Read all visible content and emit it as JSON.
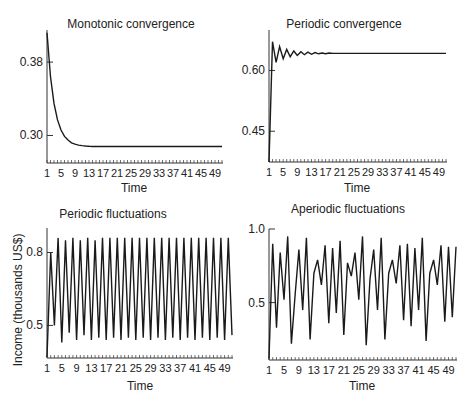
{
  "figure": {
    "shared_ylabel": "Income (thousands US$)",
    "line_color": "#1a1a1a",
    "axis_color": "#333333",
    "text_color": "#222222"
  },
  "chart_data": [
    {
      "type": "line",
      "title": "Monotonic convergence",
      "xlabel": "Time",
      "ylabel": "",
      "x_ticks": [
        1,
        5,
        9,
        13,
        17,
        21,
        25,
        29,
        33,
        37,
        41,
        45,
        49
      ],
      "y_ticks": [
        0.3,
        0.38
      ],
      "y_tick_labels": [
        "0.30",
        "0.38"
      ],
      "ylim": [
        0.27,
        0.415
      ],
      "x": [
        1,
        2,
        3,
        4,
        5,
        6,
        7,
        8,
        9,
        10,
        11,
        12,
        13,
        14,
        15,
        16,
        17,
        18,
        19,
        20,
        21,
        22,
        23,
        24,
        25,
        26,
        27,
        28,
        29,
        30,
        31,
        32,
        33,
        34,
        35,
        36,
        37,
        38,
        39,
        40,
        41,
        42,
        43,
        44,
        45,
        46,
        47,
        48,
        49,
        50,
        51
      ],
      "values": [
        0.412,
        0.364,
        0.335,
        0.317,
        0.306,
        0.299,
        0.295,
        0.292,
        0.2905,
        0.2895,
        0.289,
        0.2885,
        0.2882,
        0.288,
        0.288,
        0.288,
        0.288,
        0.288,
        0.288,
        0.288,
        0.288,
        0.288,
        0.288,
        0.288,
        0.288,
        0.288,
        0.288,
        0.288,
        0.288,
        0.288,
        0.288,
        0.288,
        0.288,
        0.288,
        0.288,
        0.288,
        0.288,
        0.288,
        0.288,
        0.288,
        0.288,
        0.288,
        0.288,
        0.288,
        0.288,
        0.288,
        0.288,
        0.288,
        0.288,
        0.288,
        0.288
      ],
      "grid": false
    },
    {
      "type": "line",
      "title": "Periodic convergence",
      "xlabel": "Time",
      "ylabel": "",
      "x_ticks": [
        1,
        5,
        9,
        13,
        17,
        21,
        25,
        29,
        33,
        37,
        41,
        45,
        49
      ],
      "y_ticks": [
        0.45,
        0.6
      ],
      "y_tick_labels": [
        "0.45",
        "0.60"
      ],
      "ylim": [
        0.374,
        0.69
      ],
      "x": [
        1,
        2,
        3,
        4,
        5,
        6,
        7,
        8,
        9,
        10,
        11,
        12,
        13,
        14,
        15,
        16,
        17,
        18,
        19,
        20,
        21,
        22,
        23,
        24,
        25,
        26,
        27,
        28,
        29,
        30,
        31,
        32,
        33,
        34,
        35,
        36,
        37,
        38,
        39,
        40,
        41,
        42,
        43,
        44,
        45,
        46,
        47,
        48,
        49,
        50,
        51
      ],
      "values": [
        0.374,
        0.671,
        0.62,
        0.659,
        0.629,
        0.652,
        0.634,
        0.648,
        0.637,
        0.646,
        0.639,
        0.645,
        0.64,
        0.644,
        0.641,
        0.643,
        0.641,
        0.643,
        0.642,
        0.642,
        0.642,
        0.642,
        0.642,
        0.642,
        0.642,
        0.642,
        0.642,
        0.642,
        0.642,
        0.642,
        0.642,
        0.642,
        0.642,
        0.642,
        0.642,
        0.642,
        0.642,
        0.642,
        0.642,
        0.642,
        0.642,
        0.642,
        0.642,
        0.642,
        0.642,
        0.642,
        0.642,
        0.642,
        0.642,
        0.642,
        0.642
      ],
      "grid": false
    },
    {
      "type": "line",
      "title": "Periodic fluctuations",
      "xlabel": "Time",
      "ylabel": "Income (thousands US$)",
      "x_ticks": [
        1,
        5,
        9,
        13,
        17,
        21,
        25,
        29,
        33,
        37,
        41,
        45,
        49
      ],
      "y_ticks": [
        0.5,
        0.8
      ],
      "y_tick_labels": [
        "0.5",
        "0.8"
      ],
      "ylim": [
        0.366,
        0.88
      ],
      "x": [
        1,
        2,
        3,
        4,
        5,
        6,
        7,
        8,
        9,
        10,
        11,
        12,
        13,
        14,
        15,
        16,
        17,
        18,
        19,
        20,
        21,
        22,
        23,
        24,
        25,
        26,
        27,
        28,
        29,
        30,
        31,
        32,
        33,
        34,
        35,
        36,
        37,
        38,
        39,
        40,
        41,
        42,
        43,
        44,
        45,
        46,
        47,
        48,
        49,
        50,
        51
      ],
      "values": [
        0.37,
        0.8,
        0.5,
        0.86,
        0.43,
        0.85,
        0.47,
        0.86,
        0.44,
        0.85,
        0.46,
        0.86,
        0.44,
        0.85,
        0.45,
        0.86,
        0.44,
        0.86,
        0.45,
        0.86,
        0.44,
        0.86,
        0.45,
        0.86,
        0.44,
        0.86,
        0.45,
        0.86,
        0.44,
        0.86,
        0.45,
        0.86,
        0.44,
        0.86,
        0.45,
        0.86,
        0.44,
        0.86,
        0.45,
        0.86,
        0.44,
        0.86,
        0.45,
        0.86,
        0.44,
        0.86,
        0.45,
        0.86,
        0.44,
        0.86,
        0.46
      ],
      "grid": false
    },
    {
      "type": "line",
      "title": "Aperiodic fluctuations",
      "xlabel": "Time",
      "ylabel": "",
      "x_ticks": [
        1,
        5,
        9,
        13,
        17,
        21,
        25,
        29,
        33,
        37,
        41,
        45,
        49
      ],
      "y_ticks": [
        0.5,
        1.0
      ],
      "y_tick_labels": [
        "0.5",
        "1.0"
      ],
      "ylim": [
        0.11,
        1.0
      ],
      "x": [
        1,
        2,
        3,
        4,
        5,
        6,
        7,
        8,
        9,
        10,
        11,
        12,
        13,
        14,
        15,
        16,
        17,
        18,
        19,
        20,
        21,
        22,
        23,
        24,
        25,
        26,
        27,
        28,
        29,
        30,
        31,
        32,
        33,
        34,
        35,
        36,
        37,
        38,
        39,
        40,
        41,
        42,
        43,
        44,
        45,
        46,
        47,
        48,
        49,
        50,
        51
      ],
      "values": [
        0.12,
        0.9,
        0.33,
        0.84,
        0.52,
        0.95,
        0.22,
        0.56,
        0.86,
        0.45,
        0.94,
        0.25,
        0.7,
        0.79,
        0.62,
        0.89,
        0.36,
        0.87,
        0.43,
        0.92,
        0.28,
        0.77,
        0.68,
        0.84,
        0.52,
        0.95,
        0.21,
        0.66,
        0.86,
        0.45,
        0.94,
        0.25,
        0.7,
        0.79,
        0.63,
        0.89,
        0.38,
        0.9,
        0.34,
        0.87,
        0.45,
        0.94,
        0.24,
        0.7,
        0.79,
        0.62,
        0.89,
        0.37,
        0.88,
        0.4,
        0.88
      ],
      "grid": false
    }
  ]
}
